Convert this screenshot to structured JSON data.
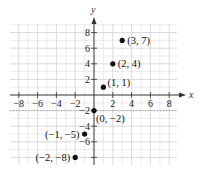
{
  "chart_data": {
    "type": "scatter",
    "title": "",
    "xlabel": "x",
    "ylabel": "y",
    "xlim": [
      -9,
      9
    ],
    "ylim": [
      -9,
      9
    ],
    "grid": true,
    "x_ticks": [
      -8,
      -6,
      -4,
      -2,
      2,
      4,
      6,
      8
    ],
    "y_ticks": [
      -8,
      -6,
      -4,
      -2,
      2,
      4,
      6,
      8
    ],
    "x_tick_labels": [
      "−8",
      "−6",
      "−4",
      "−2",
      "2",
      "4",
      "6",
      "8"
    ],
    "y_tick_labels_visible": [
      "−6",
      "−4",
      "−2",
      "2",
      "4",
      "6",
      "8"
    ],
    "series": [
      {
        "name": "points",
        "points": [
          {
            "x": -2,
            "y": -8,
            "label": "(−2, −8)"
          },
          {
            "x": -1,
            "y": -5,
            "label": "(−1, −5)"
          },
          {
            "x": 0,
            "y": -2,
            "label": "(0, −2)"
          },
          {
            "x": 1,
            "y": 1,
            "label": "(1, 1)"
          },
          {
            "x": 2,
            "y": 4,
            "label": "(2, 4)"
          },
          {
            "x": 3,
            "y": 7,
            "label": "(3, 7)"
          }
        ]
      }
    ],
    "colors": {
      "point": "#111111",
      "axis": "#333333",
      "grid": "#cfcfcf",
      "background": "#ffffff"
    }
  }
}
